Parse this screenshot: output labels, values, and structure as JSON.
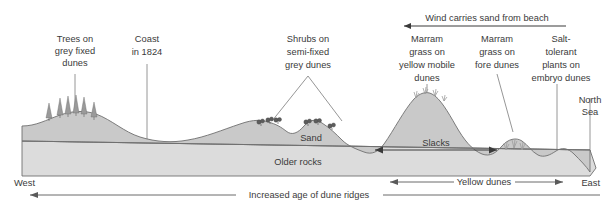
{
  "diagram": {
    "colors": {
      "sand_fill": "#c9c9c9",
      "rock_fill": "#dcdcdc",
      "outline": "#6f6f6f",
      "text": "#3a3a3a",
      "leader": "#8a8a8a"
    }
  },
  "callouts": {
    "trees": {
      "line1": "Trees on",
      "line2": "grey fixed",
      "line3": "dunes"
    },
    "coast": {
      "line1": "Coast",
      "line2": "in 1824"
    },
    "shrubs": {
      "line1": "Shrubs on",
      "line2": "semi-fixed",
      "line3": "grey dunes"
    },
    "marram_yellow": {
      "line1": "Marram",
      "line2": "grass on",
      "line3": "yellow mobile",
      "line4": "dunes"
    },
    "marram_fore": {
      "line1": "Marram",
      "line2": "grass on",
      "line3": "fore dunes"
    },
    "salt_tolerant": {
      "line1": "Salt-",
      "line2": "tolerant",
      "line3": "plants on",
      "line4": "embryo dunes"
    },
    "north_sea": {
      "line1": "North",
      "line2": "Sea"
    }
  },
  "annotations": {
    "wind": "Wind carries sand from beach",
    "sand_layer": "Sand",
    "older_rocks_layer": "Older rocks",
    "slacks": "Slacks"
  },
  "axes": {
    "west": "West",
    "east": "East",
    "increased_age": "Increased age of dune ridges",
    "yellow_dunes": "Yellow dunes"
  }
}
